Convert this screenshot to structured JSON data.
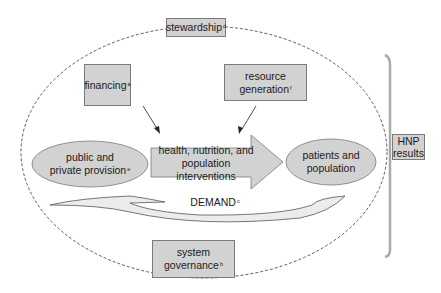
{
  "diagram": {
    "boxes": {
      "stewardship": {
        "label": "stewardship",
        "note": "d"
      },
      "financing": {
        "label": "financing",
        "note": "a"
      },
      "resource_generation": {
        "line1": "resource",
        "line2": "generation",
        "note": "f"
      },
      "system_governance": {
        "line1": "system",
        "line2": "governance",
        "note": "b"
      },
      "hnp_results": {
        "line1": "HNP",
        "line2": "results"
      }
    },
    "ellipses": {
      "provision": {
        "line1": "public and",
        "line2": "private provision",
        "note": "e"
      },
      "patients": {
        "line1": "patients and",
        "line2": "population"
      }
    },
    "interventions_arrow": {
      "line1": "health, nutrition, and",
      "line2": "population interventions"
    },
    "demand": {
      "label": "DEMAND",
      "note": "c"
    },
    "colors": {
      "fill": "#d2d2d2",
      "stroke": "#7a7a7a",
      "dash": "#333333",
      "bracket": "#aaaaaa"
    }
  }
}
